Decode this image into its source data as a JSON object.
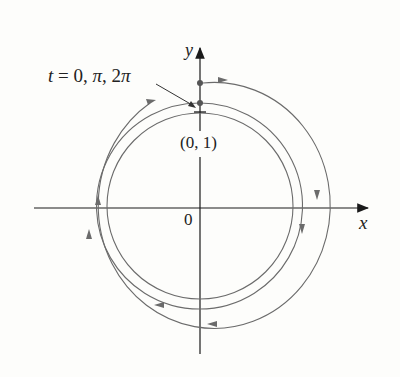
{
  "figure": {
    "axes": {
      "x_label": "x",
      "y_label": "y",
      "origin_label": "0"
    },
    "point_label": "(0, 1)",
    "annotation": {
      "t_var": "t",
      "equals": " = 0, ",
      "pi1": "π",
      "comma": ", 2",
      "pi2": "π"
    },
    "colors": {
      "curve": "#6b6b6b",
      "axes": "#1a1a1a",
      "background": "#fdfdfb"
    }
  }
}
